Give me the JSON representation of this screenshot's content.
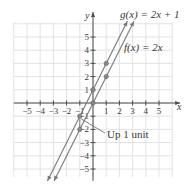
{
  "chart_data": {
    "type": "line",
    "title": "",
    "xlabel": "x",
    "ylabel": "y",
    "xlim": [
      -5,
      5
    ],
    "ylim": [
      -5,
      5
    ],
    "grid": true,
    "x_ticks": [
      -5,
      -4,
      -3,
      -2,
      -1,
      1,
      2,
      3,
      4,
      5
    ],
    "y_ticks": [
      -5,
      -4,
      -3,
      -2,
      -1,
      1,
      2,
      3,
      4,
      5
    ],
    "x_tick_labels": [
      "−5",
      "−4",
      "−3",
      "−2",
      "−1",
      "1",
      "2",
      "3",
      "4",
      "5"
    ],
    "y_tick_labels": [
      "−5",
      "−4",
      "−3",
      "−2",
      "−1",
      "1",
      "2",
      "3",
      "4",
      "5"
    ],
    "series": [
      {
        "name": "g(x) = 2x + 1",
        "equation": "g(x) = 2x + 1",
        "slope": 2,
        "intercept": 1,
        "points": [
          {
            "x": -1,
            "y": -1
          },
          {
            "x": 0,
            "y": 1
          },
          {
            "x": 1,
            "y": 3
          }
        ]
      },
      {
        "name": "f(x) = 2x",
        "equation": "f(x) = 2x",
        "slope": 2,
        "intercept": 0,
        "points": [
          {
            "x": -1,
            "y": -2
          },
          {
            "x": 0,
            "y": 0
          },
          {
            "x": 1,
            "y": 2
          }
        ]
      }
    ],
    "annotations": [
      {
        "text": "Up 1 unit",
        "from": {
          "x": -1,
          "y": -2
        },
        "to": {
          "x": -1,
          "y": -1
        }
      }
    ],
    "labels": {
      "g": "g(x) = 2x + 1",
      "f": "f(x) = 2x",
      "annotation": "Up 1 unit",
      "x_axis": "x",
      "y_axis": "y"
    }
  },
  "colors": {
    "line": "#7a7a7a",
    "point": "#8a8a8a",
    "axis": "#4a4a4a",
    "grid": "#e2e2e2",
    "text": "#3a3a3a"
  }
}
